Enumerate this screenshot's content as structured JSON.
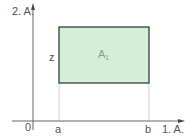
{
  "diagram": {
    "y_axis_label": "2. A.",
    "x_axis_label": "1. A.",
    "origin_label": "0",
    "x_marks": [
      "a",
      "b"
    ],
    "height_label": "z",
    "area_label": "A",
    "area_subscript": "1",
    "colors": {
      "rect_fill": "#d3f0d6",
      "rect_stroke": "#2e2e2e",
      "axis": "#666666",
      "guide": "#d0d0d0",
      "text": "#555555"
    }
  }
}
